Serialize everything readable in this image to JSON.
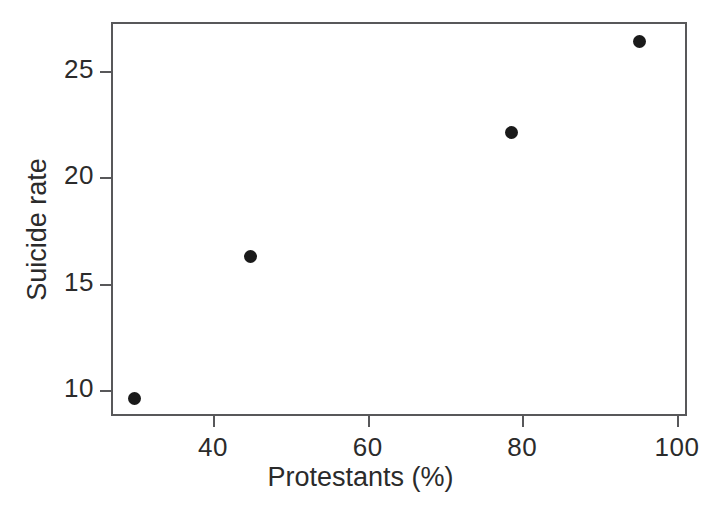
{
  "chart_data": {
    "type": "scatter",
    "title": "",
    "xlabel": "Protestants (%)",
    "ylabel": "Suicide rate",
    "xlim": [
      26,
      100.5
    ],
    "ylim": [
      8.5,
      27.4
    ],
    "xticks": [
      40,
      60,
      80,
      100
    ],
    "xtick_labels": [
      "40",
      "60",
      "80",
      "100"
    ],
    "yticks": [
      10,
      15,
      20,
      25
    ],
    "ytick_labels": [
      "10",
      "15",
      "20",
      "25"
    ],
    "grid": false,
    "legend": null,
    "marker": {
      "shape": "filled-circle",
      "color": "#1a1a1a",
      "size_px": 13
    },
    "axis_color": "#58585a",
    "background": "#ffffff",
    "x": [
      29.8,
      44.8,
      78.6,
      95.1
    ],
    "y": [
      9.6,
      16.3,
      22.1,
      26.4
    ],
    "points": [
      {
        "x": 29.8,
        "y": 9.6
      },
      {
        "x": 44.8,
        "y": 16.3
      },
      {
        "x": 78.6,
        "y": 22.1
      },
      {
        "x": 95.1,
        "y": 26.4
      }
    ]
  }
}
